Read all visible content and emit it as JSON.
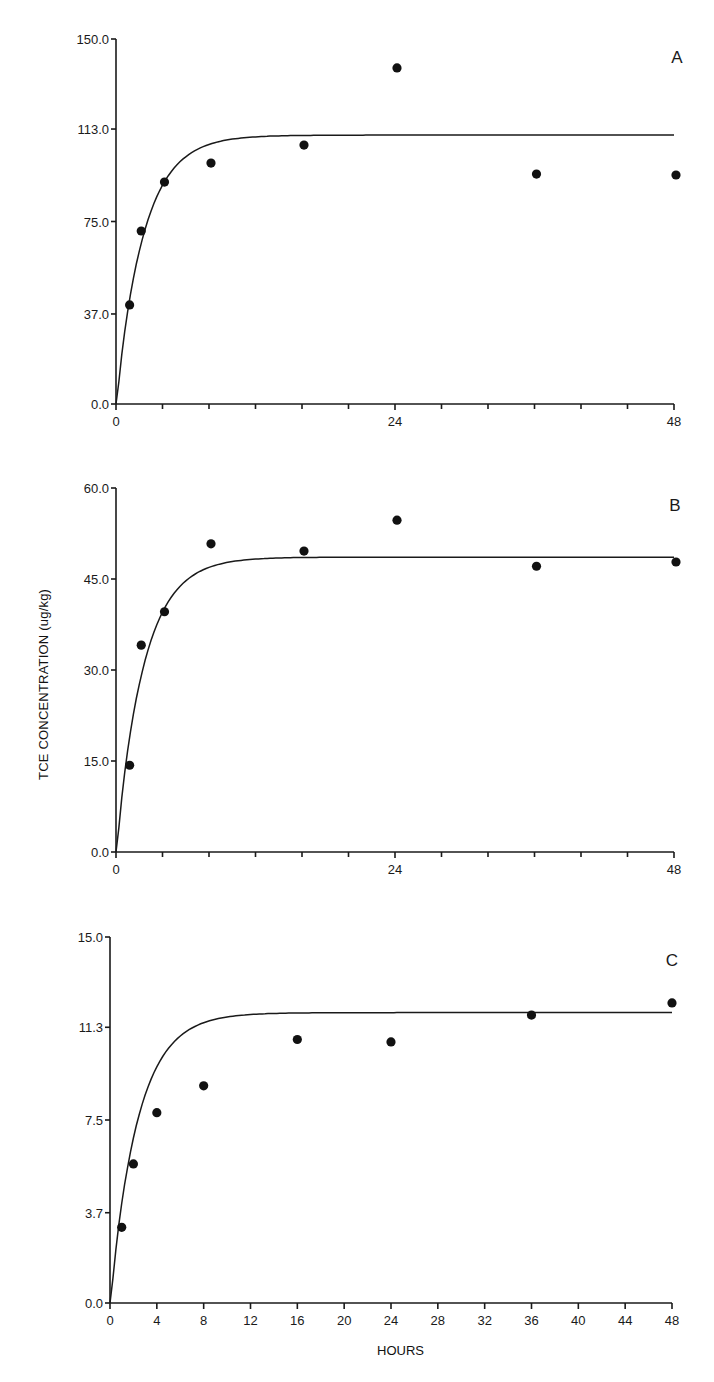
{
  "figure": {
    "y_axis_title": "TCE CONCENTRATION (ug/kg)",
    "x_axis_title": "HOURS"
  },
  "chart_data": [
    {
      "type": "scatter",
      "panel": "A",
      "title": "A",
      "xlabel": "",
      "ylabel": "",
      "xlim": [
        0,
        48
      ],
      "ylim": [
        0,
        150
      ],
      "x_ticks": [
        0,
        24,
        48
      ],
      "x_minor_ticks": [
        4,
        8,
        12,
        16,
        20,
        28,
        32,
        36,
        40,
        44
      ],
      "y_ticks": [
        0.0,
        37.0,
        75.0,
        113.0,
        150.0
      ],
      "y_tick_labels": [
        "0.0",
        "37.0",
        "75.0",
        "113.0",
        "150.0"
      ],
      "grid": false,
      "series": [
        {
          "name": "observed",
          "kind": "points",
          "x": [
            1,
            2,
            4,
            8,
            16,
            24,
            36,
            48
          ],
          "y": [
            40.7,
            71.1,
            91.2,
            99.0,
            106.4,
            138.1,
            94.5,
            94.1
          ]
        },
        {
          "name": "model fit",
          "kind": "line",
          "plateau": 110.5,
          "rate": 0.42,
          "lag": 0.3
        }
      ]
    },
    {
      "type": "scatter",
      "panel": "B",
      "title": "B",
      "xlabel": "",
      "ylabel": "TCE CONCENTRATION (ug/kg)",
      "xlim": [
        0,
        48
      ],
      "ylim": [
        0,
        60
      ],
      "x_ticks": [
        0,
        24,
        48
      ],
      "x_minor_ticks": [
        4,
        8,
        12,
        16,
        20,
        28,
        32,
        36,
        40,
        44
      ],
      "y_ticks": [
        0.0,
        15.0,
        30.0,
        45.0,
        60.0
      ],
      "y_tick_labels": [
        "0.0",
        "15.0",
        "30.0",
        "45.0",
        "60.0"
      ],
      "grid": false,
      "series": [
        {
          "name": "observed",
          "kind": "points",
          "x": [
            1,
            2,
            4,
            8,
            16,
            24,
            36,
            48
          ],
          "y": [
            14.3,
            34.1,
            39.6,
            50.8,
            49.6,
            54.7,
            47.1,
            47.8
          ]
        },
        {
          "name": "model fit",
          "kind": "line",
          "plateau": 48.6,
          "rate": 0.42,
          "lag": 0.3
        }
      ]
    },
    {
      "type": "scatter",
      "panel": "C",
      "title": "C",
      "xlabel": "HOURS",
      "ylabel": "",
      "xlim": [
        0,
        48
      ],
      "ylim": [
        0,
        15
      ],
      "x_ticks": [
        0,
        4,
        8,
        12,
        16,
        20,
        24,
        28,
        32,
        36,
        40,
        44,
        48
      ],
      "x_minor_ticks": [],
      "y_ticks": [
        0.0,
        3.7,
        7.5,
        11.3,
        15.0
      ],
      "y_tick_labels": [
        "0.0",
        "3.7",
        "7.5",
        "11.3",
        "15.0"
      ],
      "grid": false,
      "series": [
        {
          "name": "observed",
          "kind": "points",
          "x": [
            1,
            2,
            4,
            8,
            16,
            24,
            36,
            48
          ],
          "y": [
            3.1,
            5.7,
            7.8,
            8.9,
            10.8,
            10.7,
            11.8,
            12.3
          ]
        },
        {
          "name": "model fit",
          "kind": "line",
          "plateau": 11.9,
          "rate": 0.42,
          "lag": 0.3
        }
      ]
    }
  ],
  "layout": {
    "panels": [
      {
        "x0": 116,
        "x1": 674,
        "y_top": 39,
        "y_bottom": 404,
        "letter_x": 677,
        "letter_y": 63
      },
      {
        "x0": 116,
        "x1": 674,
        "y_top": 488,
        "y_bottom": 852,
        "letter_x": 675,
        "letter_y": 511
      },
      {
        "x0": 110,
        "x1": 672,
        "y_top": 937,
        "y_bottom": 1303,
        "letter_x": 672,
        "letter_y": 966
      }
    ]
  }
}
